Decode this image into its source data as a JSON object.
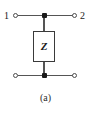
{
  "figure": {
    "caption": "(a)",
    "colors": {
      "background": "#ffffff",
      "wire": "#555555",
      "node": "#1a1a1a",
      "box_border": "#3a3a3a",
      "text": "#1a1a1a"
    }
  },
  "ports": {
    "port1_label": "1",
    "port2_label": "2"
  },
  "terminals": [
    {
      "name": "top-left",
      "label": "1"
    },
    {
      "name": "top-right",
      "label": "2"
    },
    {
      "name": "bottom-left",
      "label": ""
    },
    {
      "name": "bottom-right",
      "label": ""
    }
  ],
  "component": {
    "symbol": "Z",
    "type": "impedance",
    "orientation": "shunt"
  },
  "nodes": [
    {
      "name": "top-junction"
    },
    {
      "name": "bottom-junction"
    }
  ]
}
